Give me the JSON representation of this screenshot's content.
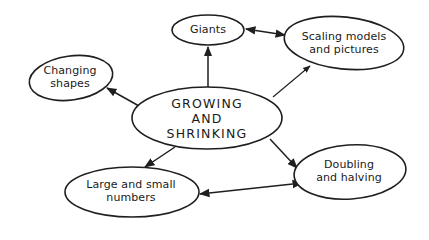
{
  "diagram": {
    "type": "mind-map",
    "colors": {
      "stroke": "#1f1f1f",
      "background": "#ffffff",
      "text": "#1a1a1a"
    },
    "center": {
      "id": "growing-and-shrinking",
      "label": "GROWING\nAND\nSHRINKING"
    },
    "nodes": [
      {
        "id": "giants",
        "label": "Giants"
      },
      {
        "id": "scaling-models",
        "label": "Scaling models\nand pictures"
      },
      {
        "id": "changing-shapes",
        "label": "Changing\nshapes"
      },
      {
        "id": "large-small-numbers",
        "label": "Large and small\nnumbers"
      },
      {
        "id": "doubling-halving",
        "label": "Doubling\nand halving"
      }
    ],
    "edges": [
      {
        "from": "growing-and-shrinking",
        "to": "giants",
        "direction": "forward"
      },
      {
        "from": "growing-and-shrinking",
        "to": "scaling-models",
        "direction": "forward"
      },
      {
        "from": "growing-and-shrinking",
        "to": "changing-shapes",
        "direction": "forward"
      },
      {
        "from": "growing-and-shrinking",
        "to": "large-small-numbers",
        "direction": "forward"
      },
      {
        "from": "growing-and-shrinking",
        "to": "doubling-halving",
        "direction": "forward"
      },
      {
        "from": "giants",
        "to": "scaling-models",
        "direction": "both"
      },
      {
        "from": "large-small-numbers",
        "to": "doubling-halving",
        "direction": "both"
      }
    ]
  }
}
